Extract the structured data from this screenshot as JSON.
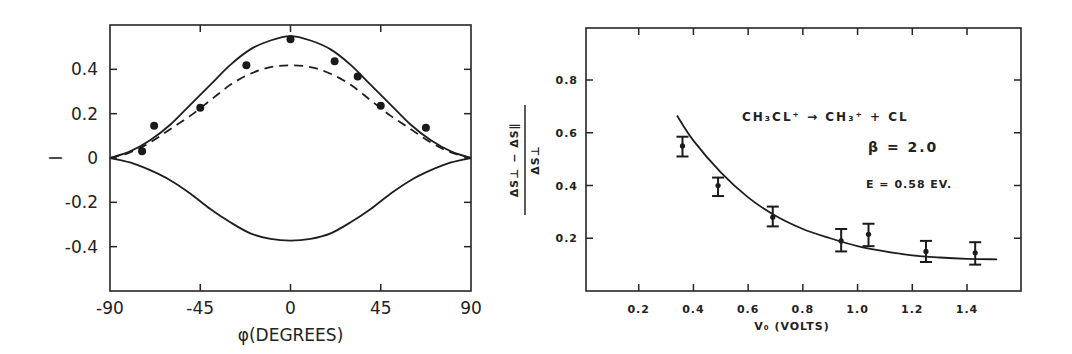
{
  "colors": {
    "background": "#ffffff",
    "ink": "#222222"
  },
  "chart_data": [
    {
      "type": "line",
      "title": "",
      "xlabel": "φ (DEGREES)",
      "ylabel": "I",
      "xlim": [
        -90,
        90
      ],
      "ylim": [
        -0.6,
        0.6
      ],
      "xticks": [
        -90,
        -45,
        0,
        45,
        90
      ],
      "xtick_labels": [
        "-90",
        "-45",
        "0",
        "45",
        "90"
      ],
      "yticks": [
        0.4,
        0.2,
        0,
        -0.2,
        -0.4
      ],
      "ytick_labels": [
        "0.4",
        "0.2",
        "0",
        "-0.2",
        "-0.4"
      ],
      "grid": false,
      "legend": null,
      "series": [
        {
          "name": "theory upper (solid)",
          "style": "solid",
          "x": [
            -90,
            -80,
            -70,
            -60,
            -50,
            -40,
            -30,
            -20,
            -10,
            0,
            10,
            20,
            30,
            40,
            50,
            60,
            70,
            80,
            90
          ],
          "y": [
            0,
            0.03,
            0.08,
            0.15,
            0.24,
            0.33,
            0.42,
            0.49,
            0.53,
            0.55,
            0.53,
            0.49,
            0.42,
            0.33,
            0.24,
            0.15,
            0.08,
            0.03,
            0
          ]
        },
        {
          "name": "theory dashed",
          "style": "dashed",
          "x": [
            -90,
            -80,
            -70,
            -60,
            -50,
            -40,
            -30,
            -20,
            -10,
            0,
            10,
            20,
            30,
            40,
            50,
            60,
            70,
            80,
            90
          ],
          "y": [
            0,
            0.025,
            0.07,
            0.13,
            0.19,
            0.26,
            0.33,
            0.38,
            0.41,
            0.418,
            0.41,
            0.38,
            0.33,
            0.26,
            0.19,
            0.13,
            0.07,
            0.025,
            0
          ]
        },
        {
          "name": "theory lower (solid)",
          "style": "solid",
          "x": [
            -90,
            -80,
            -70,
            -60,
            -50,
            -40,
            -30,
            -20,
            -10,
            0,
            10,
            20,
            30,
            40,
            50,
            60,
            70,
            80,
            90
          ],
          "y": [
            0,
            -0.02,
            -0.055,
            -0.1,
            -0.16,
            -0.23,
            -0.29,
            -0.34,
            -0.365,
            -0.373,
            -0.365,
            -0.34,
            -0.29,
            -0.23,
            -0.16,
            -0.1,
            -0.055,
            -0.02,
            0
          ]
        },
        {
          "name": "measured",
          "style": "markers",
          "x": [
            -74,
            -68,
            -45,
            -22,
            0,
            22,
            33.5,
            45,
            67.5
          ],
          "y": [
            0.03,
            0.145,
            0.227,
            0.418,
            0.536,
            0.436,
            0.368,
            0.236,
            0.136
          ]
        }
      ]
    },
    {
      "type": "scatter",
      "title": "",
      "xlabel": "V₀ (VOLTS)",
      "ylabel": "(ΔS⊥ − ΔS∥) / ΔS⊥",
      "ylabel_numerator": "ΔS⊥ − ΔS∥",
      "ylabel_denominator": "ΔS⊥",
      "xlim": [
        0,
        1.6
      ],
      "ylim": [
        0,
        1.0
      ],
      "xticks": [
        0.2,
        0.4,
        0.6,
        0.8,
        1.0,
        1.2,
        1.4
      ],
      "xtick_labels": [
        "0.2",
        "0.4",
        "0.6",
        "0.8",
        "1.0",
        "1.2",
        "1.4"
      ],
      "yticks": [
        0.8,
        0.6,
        0.4,
        0.2
      ],
      "ytick_labels": [
        "0.8",
        "0.6",
        "0.4",
        "0.2"
      ],
      "grid": false,
      "legend": null,
      "annotations": [
        "CH₃CL⁺ → CH₃⁺ + CL",
        "β = 2.0",
        "E = 0.58 EV."
      ],
      "series": [
        {
          "name": "measured",
          "style": "markers-with-errorbars",
          "x": [
            0.36,
            0.49,
            0.69,
            0.94,
            1.04,
            1.25,
            1.43
          ],
          "y": [
            0.55,
            0.4,
            0.28,
            0.19,
            0.215,
            0.15,
            0.145
          ],
          "err_low": [
            0.51,
            0.36,
            0.245,
            0.15,
            0.17,
            0.11,
            0.1
          ],
          "err_high": [
            0.585,
            0.43,
            0.32,
            0.235,
            0.255,
            0.19,
            0.185
          ]
        },
        {
          "name": "theory fit",
          "style": "solid",
          "x": [
            0.34,
            0.4,
            0.5,
            0.6,
            0.7,
            0.8,
            0.9,
            1.0,
            1.1,
            1.2,
            1.3,
            1.4,
            1.51
          ],
          "y": [
            0.665,
            0.57,
            0.45,
            0.355,
            0.285,
            0.235,
            0.2,
            0.17,
            0.15,
            0.135,
            0.127,
            0.122,
            0.12
          ]
        }
      ]
    }
  ],
  "left_chart": {
    "ylabel": "I",
    "xlabel": "φ(DEGREES)"
  },
  "right_chart": {
    "xlabel": "V₀ (VOLTS)",
    "ylabel_num": "ΔS⊥ − ΔS∥",
    "ylabel_den": "ΔS⊥",
    "reaction": "CH₃CL⁺ → CH₃⁺ + CL",
    "beta": "β = 2.0",
    "energy": "E = 0.58 EV."
  }
}
